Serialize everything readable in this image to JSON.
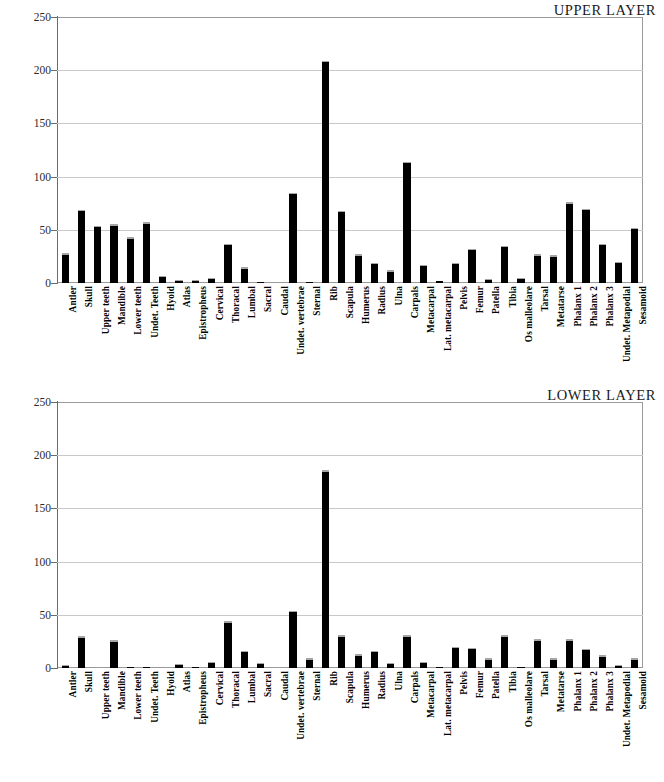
{
  "page": {
    "background": "#ffffff",
    "bar_color": "#000000",
    "grid_color": "#c8c8c8",
    "axis_color": "#6b6b6b"
  },
  "categories": [
    "Antler",
    "Skull",
    "Upper teeth",
    "Mandible",
    "Lower teeth",
    "Undet. Teeth",
    "Hyoid",
    "Atlas",
    "Epistropheus",
    "Cervical",
    "Thoracal",
    "Lumbal",
    "Sacral",
    "Caudal",
    "Undet. vertebrae",
    "Sternal",
    "Rib",
    "Scapula",
    "Humerus",
    "Radius",
    "Ulna",
    "Carpals",
    "Metacarpal",
    "Lat. metacarpal",
    "Pelvis",
    "Femur",
    "Patella",
    "Tibia",
    "Os malleolare",
    "Tarsal",
    "Metatarse",
    "Phalanx 1",
    "Phalanx 2",
    "Phalanx 3",
    "Undet. Metapodial",
    "Sesamoid"
  ],
  "yticks": [
    0,
    50,
    100,
    150,
    200,
    250
  ],
  "charts": [
    {
      "id": "upper",
      "title": "UPPER LAYER",
      "values": [
        28,
        69,
        54,
        55,
        43,
        57,
        7,
        3,
        3,
        5,
        37,
        15,
        1,
        0,
        85,
        1,
        209,
        68,
        27,
        19,
        12,
        114,
        17,
        2,
        19,
        32,
        4,
        35,
        5,
        27,
        26,
        76,
        70,
        37,
        20,
        52
      ]
    },
    {
      "id": "lower",
      "title": "LOWER LAYER",
      "values": [
        3,
        30,
        0,
        26,
        1,
        1,
        0,
        4,
        1,
        6,
        44,
        16,
        5,
        0,
        54,
        9,
        186,
        31,
        13,
        16,
        5,
        31,
        6,
        1,
        20,
        19,
        9,
        31,
        1,
        27,
        9,
        27,
        18,
        12,
        3,
        9
      ]
    }
  ],
  "chart_data": [
    {
      "type": "bar",
      "title": "UPPER LAYER",
      "xlabel": "",
      "ylabel": "",
      "ylim": [
        0,
        250
      ],
      "yticks": [
        0,
        50,
        100,
        150,
        200,
        250
      ],
      "grid": true,
      "legend": "none",
      "categories": [
        "Antler",
        "Skull",
        "Upper teeth",
        "Mandible",
        "Lower teeth",
        "Undet. Teeth",
        "Hyoid",
        "Atlas",
        "Epistropheus",
        "Cervical",
        "Thoracal",
        "Lumbal",
        "Sacral",
        "Caudal",
        "Undet. vertebrae",
        "Sternal",
        "Rib",
        "Scapula",
        "Humerus",
        "Radius",
        "Ulna",
        "Carpals",
        "Metacarpal",
        "Lat. metacarpal",
        "Pelvis",
        "Femur",
        "Patella",
        "Tibia",
        "Os malleolare",
        "Tarsal",
        "Metatarse",
        "Phalanx 1",
        "Phalanx 2",
        "Phalanx 3",
        "Undet. Metapodial",
        "Sesamoid"
      ],
      "values": [
        28,
        69,
        54,
        55,
        43,
        57,
        7,
        3,
        3,
        5,
        37,
        15,
        1,
        0,
        85,
        1,
        209,
        68,
        27,
        19,
        12,
        114,
        17,
        2,
        19,
        32,
        4,
        35,
        5,
        27,
        26,
        76,
        70,
        37,
        20,
        52
      ]
    },
    {
      "type": "bar",
      "title": "LOWER LAYER",
      "xlabel": "",
      "ylabel": "",
      "ylim": [
        0,
        250
      ],
      "yticks": [
        0,
        50,
        100,
        150,
        200,
        250
      ],
      "grid": true,
      "legend": "none",
      "categories": [
        "Antler",
        "Skull",
        "Upper teeth",
        "Mandible",
        "Lower teeth",
        "Undet. Teeth",
        "Hyoid",
        "Atlas",
        "Epistropheus",
        "Cervical",
        "Thoracal",
        "Lumbal",
        "Sacral",
        "Caudal",
        "Undet. vertebrae",
        "Sternal",
        "Rib",
        "Scapula",
        "Humerus",
        "Radius",
        "Ulna",
        "Carpals",
        "Metacarpal",
        "Lat. metacarpal",
        "Pelvis",
        "Femur",
        "Patella",
        "Tibia",
        "Os malleolare",
        "Tarsal",
        "Metatarse",
        "Phalanx 1",
        "Phalanx 2",
        "Phalanx 3",
        "Undet. Metapodial",
        "Sesamoid"
      ],
      "values": [
        3,
        30,
        0,
        26,
        1,
        1,
        0,
        4,
        1,
        6,
        44,
        16,
        5,
        0,
        54,
        9,
        186,
        31,
        13,
        16,
        5,
        31,
        6,
        1,
        20,
        19,
        9,
        31,
        1,
        27,
        9,
        27,
        18,
        12,
        3,
        9
      ]
    }
  ]
}
